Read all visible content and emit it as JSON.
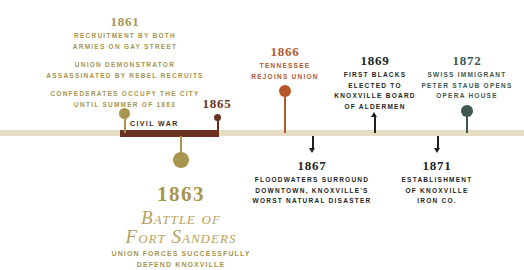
{
  "axis": {
    "civil_war_label": "CIVIL WAR",
    "baseline_color": "#e3ddc4",
    "war_bar_color": "#6b3120"
  },
  "colors": {
    "gold": "#a8954e",
    "rust": "#b5572a",
    "dark": "#231f1c",
    "teal": "#3e5850",
    "brown": "#6b3120"
  },
  "events": [
    {
      "id": "1861",
      "year": "1861",
      "color": "#a8954e",
      "lines": [
        "RECRUITMENT BY BOTH",
        "ARMIES ON GAY STREET",
        "",
        "UNION DEMONSTRATOR",
        "ASSASSINATED BY REBEL RECRUITS",
        "",
        "CONFEDERATES OCCUPY THE CITY",
        "UNTIL SUMMER OF 1863"
      ]
    },
    {
      "id": "1865",
      "year": "1865",
      "color": "#6b3120",
      "lines": []
    },
    {
      "id": "1866",
      "year": "1866",
      "color": "#b5572a",
      "lines": [
        "TENNESSEE",
        "REJOINS UNION"
      ]
    },
    {
      "id": "1867",
      "year": "1867",
      "color": "#231f1c",
      "lines": [
        "FLOODWATERS SURROUND",
        "DOWNTOWN, KNOXVILLE'S",
        "WORST NATURAL DISASTER"
      ]
    },
    {
      "id": "1869",
      "year": "1869",
      "color": "#231f1c",
      "lines": [
        "FIRST BLACKS",
        "ELECTED TO",
        "KNOXVILLE BOARD",
        "OF ALDERMEN"
      ]
    },
    {
      "id": "1871",
      "year": "1871",
      "color": "#231f1c",
      "lines": [
        "ESTABLISHMENT",
        "OF KNOXVILLE",
        "IRON CO."
      ]
    },
    {
      "id": "1872",
      "year": "1872",
      "color": "#3e5850",
      "lines": [
        "SWISS IMMIGRANT",
        "PETER STAUB OPENS",
        "OPERA HOUSE"
      ]
    }
  ],
  "feature": {
    "year": "1863",
    "title_line1": "Battle of",
    "title_line2": "Fort Sanders",
    "sub_line1": "UNION FORCES SUCCESSFULLY",
    "sub_line2": "DEFEND KNOXVILLE"
  }
}
